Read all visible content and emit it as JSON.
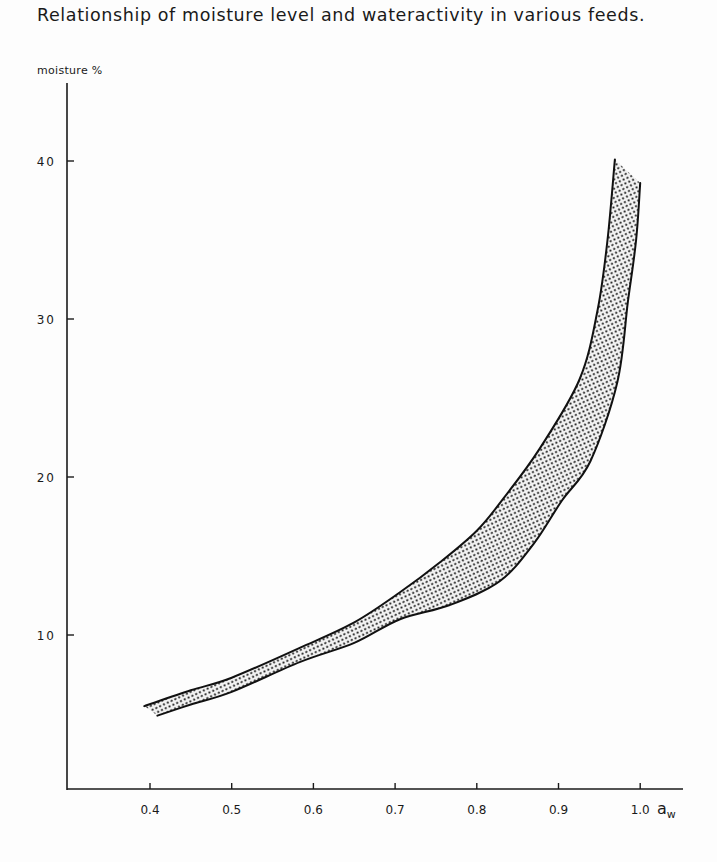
{
  "title": "Relationship of moisture level and wateractivity in various feeds.",
  "chart_data": {
    "type": "area",
    "title": "Relationship of moisture level and wateractivity in various feeds.",
    "xlabel": "a_w",
    "xlabel_display": "a",
    "xlabel_sub": "w",
    "ylabel": "moisture %",
    "xlim": [
      0.32,
      1.05
    ],
    "ylim": [
      0,
      45
    ],
    "x_ticks": [
      0.4,
      0.5,
      0.6,
      0.7,
      0.8,
      0.9,
      1.0
    ],
    "x_tick_labels": [
      "0.4",
      "0.5",
      "0.6",
      "0.7",
      "0.8",
      "0.9",
      "1.0"
    ],
    "y_ticks": [
      10,
      20,
      30,
      40
    ],
    "y_tick_labels": [
      "10",
      "20",
      "30",
      "40"
    ],
    "grid": false,
    "legend": null,
    "fill": "stippled band between upper and lower curves",
    "series": [
      {
        "name": "upper boundary",
        "x": [
          0.393,
          0.45,
          0.5,
          0.584,
          0.65,
          0.706,
          0.755,
          0.8,
          0.832,
          0.877,
          0.926,
          0.948,
          0.96,
          0.969
        ],
        "y": [
          5.5,
          6.5,
          7.3,
          9.2,
          10.8,
          12.7,
          14.6,
          16.6,
          18.6,
          21.8,
          26.2,
          30.6,
          35.0,
          40.1
        ]
      },
      {
        "name": "lower boundary",
        "x": [
          0.409,
          0.45,
          0.5,
          0.584,
          0.65,
          0.706,
          0.767,
          0.828,
          0.87,
          0.904,
          0.939,
          0.972,
          0.985,
          0.995,
          1.0
        ],
        "y": [
          4.9,
          5.6,
          6.4,
          8.3,
          9.5,
          11.0,
          11.9,
          13.4,
          15.8,
          18.5,
          21.0,
          26.0,
          31.1,
          35.0,
          38.6
        ]
      }
    ]
  }
}
